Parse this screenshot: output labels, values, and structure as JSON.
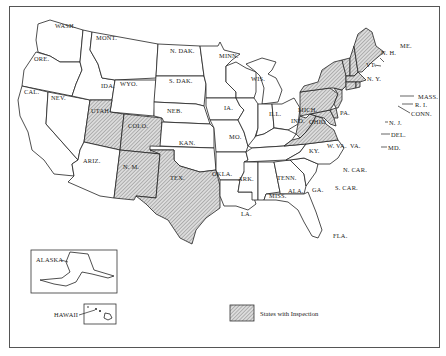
{
  "map": {
    "legend": {
      "label": "States with Inspection",
      "swatch": "hatched"
    },
    "colors": {
      "background": "#ffffff",
      "border": "#222222",
      "hatch_fill": "#d9d9d9",
      "hatch_line": "#777777"
    },
    "states_with_inspection": [
      "UTAH",
      "COLO.",
      "N. M.",
      "TEX.",
      "PA.",
      "N. Y.",
      "VT.",
      "N. H.",
      "ME.",
      "MASS.",
      "R. I.",
      "CONN.",
      "N. J.",
      "DEL.",
      "MD.",
      "W. VA.",
      "VA."
    ],
    "labels": {
      "wash": "WASH.",
      "ore": "ORE.",
      "cal": "CAL.",
      "nev": "NEV.",
      "ida": "IDA.",
      "mont": "MONT.",
      "wyo": "WYO.",
      "utah": "UTAH",
      "colo": "COLO.",
      "ariz": "ARIZ.",
      "nm": "N. M.",
      "ndak": "N. DAK.",
      "sdak": "S. DAK.",
      "neb": "NEB.",
      "kan": "KAN.",
      "okla": "OKLA.",
      "tex": "TEX.",
      "minn": "MINN.",
      "ia": "IA.",
      "mo": "MO.",
      "ark": "ARK.",
      "la": "LA.",
      "wis": "WIS.",
      "ill": "ILL.",
      "mich": "MICH.",
      "ind": "IND.",
      "ohio": "OHIO",
      "ky": "KY.",
      "tenn": "TENN.",
      "miss": "MISS.",
      "ala": "ALA.",
      "ga": "GA.",
      "fla": "FLA.",
      "scar": "S. CAR.",
      "ncar": "N. CAR.",
      "va": "VA.",
      "wva": "W. VA.",
      "md": "MD.",
      "del": "DEL.",
      "nj": "N. J.",
      "pa": "PA.",
      "ny": "N. Y.",
      "vt": "VT.",
      "nh": "N. H.",
      "me": "ME.",
      "mass": "MASS.",
      "ri": "R. I.",
      "conn": "CONN.",
      "alaska": "ALASKA",
      "hawaii": "HAWAII"
    }
  }
}
